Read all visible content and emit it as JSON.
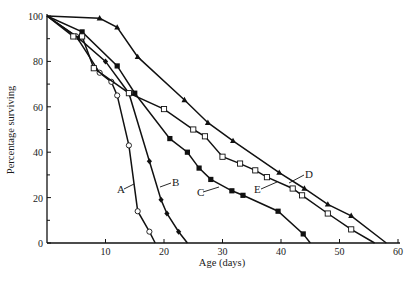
{
  "chart_data": {
    "type": "line",
    "title": "",
    "xlabel": "Age (days)",
    "ylabel": "Percentage surviving",
    "xlim": [
      0,
      60
    ],
    "ylim": [
      0,
      100
    ],
    "x_ticks": [
      10,
      20,
      30,
      40,
      50,
      60
    ],
    "y_ticks": [
      0,
      20,
      40,
      60,
      80,
      100
    ],
    "grid": false,
    "legend": "inline labels",
    "series": [
      {
        "name": "A",
        "marker": "open-circle",
        "points": [
          [
            0,
            100
          ],
          [
            5,
            91
          ],
          [
            9,
            75
          ],
          [
            11,
            71
          ],
          [
            12,
            65
          ],
          [
            14,
            43
          ],
          [
            15.5,
            14
          ],
          [
            17.5,
            5
          ],
          [
            18.5,
            0
          ]
        ],
        "label_pos": [
          12.5,
          23
        ]
      },
      {
        "name": "B",
        "marker": "filled-diamond",
        "points": [
          [
            0,
            100
          ],
          [
            5.5,
            90
          ],
          [
            10,
            80
          ],
          [
            14,
            66
          ],
          [
            17.5,
            36
          ],
          [
            19.5,
            19
          ],
          [
            20.5,
            13
          ],
          [
            22.5,
            5
          ],
          [
            24,
            0
          ]
        ],
        "label_pos": [
          21.5,
          27
        ]
      },
      {
        "name": "C",
        "marker": "filled-square",
        "points": [
          [
            0,
            100
          ],
          [
            6,
            93
          ],
          [
            12,
            78
          ],
          [
            15,
            66
          ],
          [
            21,
            46
          ],
          [
            24,
            40
          ],
          [
            26,
            33
          ],
          [
            28,
            28
          ],
          [
            31.6,
            23
          ],
          [
            33.5,
            21
          ],
          [
            39.5,
            14
          ],
          [
            43.8,
            4
          ],
          [
            45,
            0
          ]
        ],
        "label_pos": [
          27,
          18
        ]
      },
      {
        "name": "D",
        "marker": "filled-triangle",
        "points": [
          [
            0,
            100
          ],
          [
            9,
            99
          ],
          [
            12,
            95
          ],
          [
            15.5,
            82
          ],
          [
            23.5,
            63
          ],
          [
            27.5,
            53
          ],
          [
            31.8,
            45
          ],
          [
            39.7,
            31
          ],
          [
            44,
            24
          ],
          [
            48,
            17
          ],
          [
            52,
            12
          ],
          [
            58,
            0
          ]
        ],
        "label_pos": [
          45,
          30
        ]
      },
      {
        "name": "E",
        "marker": "open-square",
        "points": [
          [
            0,
            100
          ],
          [
            4.5,
            91
          ],
          [
            6,
            91
          ],
          [
            8,
            77
          ],
          [
            14,
            66
          ],
          [
            20,
            59
          ],
          [
            25,
            50
          ],
          [
            27,
            47
          ],
          [
            30,
            38
          ],
          [
            33,
            35
          ],
          [
            35.6,
            32
          ],
          [
            37.6,
            29
          ],
          [
            42,
            24
          ],
          [
            43.6,
            21
          ],
          [
            48,
            13
          ],
          [
            52,
            6
          ],
          [
            56,
            0
          ]
        ],
        "label_pos": [
          37,
          20
        ]
      }
    ]
  }
}
